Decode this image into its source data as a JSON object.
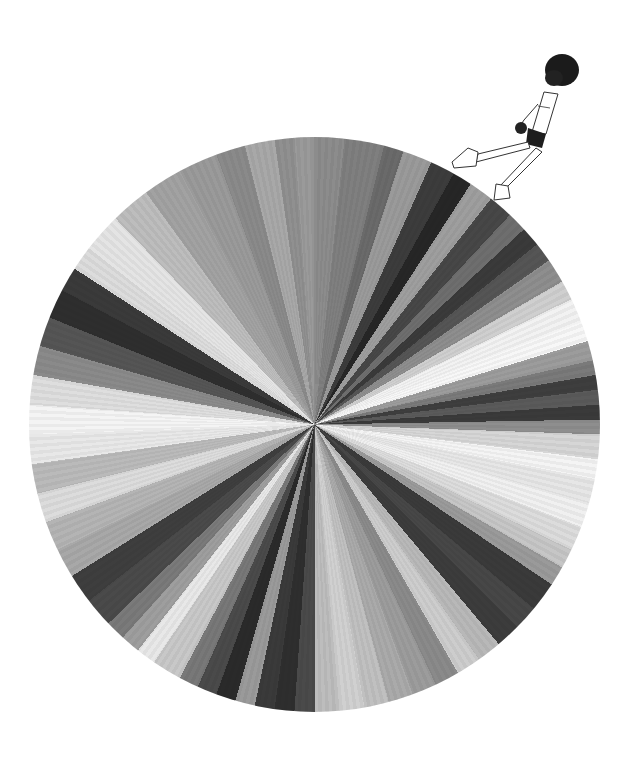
{
  "illustration": {
    "description": "Grayscale radial wheel of wedges with a small figure walking on its rim",
    "background": "#ffffff",
    "wheel": {
      "center": [
        314,
        422
      ],
      "radius_x": 285,
      "radius_y": 287,
      "wedges": [
        {
          "start": 0,
          "end": 6,
          "color": "#8c8c8c"
        },
        {
          "start": 6,
          "end": 14,
          "color": "#7f7f7f"
        },
        {
          "start": 14,
          "end": 18,
          "color": "#6a6a6a"
        },
        {
          "start": 18,
          "end": 24,
          "color": "#9a9a9a"
        },
        {
          "start": 24,
          "end": 29,
          "color": "#3c3c3c"
        },
        {
          "start": 29,
          "end": 33,
          "color": "#262626"
        },
        {
          "start": 33,
          "end": 38,
          "color": "#9e9e9e"
        },
        {
          "start": 38,
          "end": 43,
          "color": "#474747"
        },
        {
          "start": 43,
          "end": 47,
          "color": "#6e6e6e"
        },
        {
          "start": 47,
          "end": 51,
          "color": "#3a3a3a"
        },
        {
          "start": 51,
          "end": 55,
          "color": "#555555"
        },
        {
          "start": 55,
          "end": 60,
          "color": "#8e8e8e"
        },
        {
          "start": 60,
          "end": 64,
          "color": "#cfcfcf"
        },
        {
          "start": 64,
          "end": 69,
          "color": "#f2f2f2"
        },
        {
          "start": 69,
          "end": 73,
          "color": "#f7f7f7"
        },
        {
          "start": 73,
          "end": 77,
          "color": "#9c9c9c"
        },
        {
          "start": 77,
          "end": 80,
          "color": "#7a7a7a"
        },
        {
          "start": 80,
          "end": 83,
          "color": "#3e3e3e"
        },
        {
          "start": 83,
          "end": 86,
          "color": "#5a5a5a"
        },
        {
          "start": 86,
          "end": 89,
          "color": "#3a3a3a"
        },
        {
          "start": 89,
          "end": 92,
          "color": "#8e8e8e"
        },
        {
          "start": 92,
          "end": 97,
          "color": "#d6d6d6"
        },
        {
          "start": 97,
          "end": 101,
          "color": "#f4f4f4"
        },
        {
          "start": 101,
          "end": 106,
          "color": "#e6e6e6"
        },
        {
          "start": 106,
          "end": 111,
          "color": "#f0f0f0"
        },
        {
          "start": 111,
          "end": 116,
          "color": "#dcdcdc"
        },
        {
          "start": 116,
          "end": 120,
          "color": "#c6c6c6"
        },
        {
          "start": 120,
          "end": 124,
          "color": "#9a9a9a"
        },
        {
          "start": 124,
          "end": 130,
          "color": "#3a3a3a"
        },
        {
          "start": 130,
          "end": 135,
          "color": "#474747"
        },
        {
          "start": 135,
          "end": 140,
          "color": "#3c3c3c"
        },
        {
          "start": 140,
          "end": 145,
          "color": "#b8b8b8"
        },
        {
          "start": 145,
          "end": 150,
          "color": "#cdcdcd"
        },
        {
          "start": 150,
          "end": 155,
          "color": "#8a8a8a"
        },
        {
          "start": 155,
          "end": 160,
          "color": "#9c9c9c"
        },
        {
          "start": 160,
          "end": 165,
          "color": "#aaaaaa"
        },
        {
          "start": 165,
          "end": 170,
          "color": "#c0c0c0"
        },
        {
          "start": 170,
          "end": 175,
          "color": "#d0d0d0"
        },
        {
          "start": 175,
          "end": 180,
          "color": "#bdbdbd"
        },
        {
          "start": 180,
          "end": 184,
          "color": "#4a4a4a"
        },
        {
          "start": 184,
          "end": 188,
          "color": "#2e2e2e"
        },
        {
          "start": 188,
          "end": 192,
          "color": "#3a3a3a"
        },
        {
          "start": 192,
          "end": 196,
          "color": "#9a9a9a"
        },
        {
          "start": 196,
          "end": 200,
          "color": "#2a2a2a"
        },
        {
          "start": 200,
          "end": 204,
          "color": "#4a4a4a"
        },
        {
          "start": 204,
          "end": 208,
          "color": "#787878"
        },
        {
          "start": 208,
          "end": 214,
          "color": "#c8c8c8"
        },
        {
          "start": 214,
          "end": 218,
          "color": "#e8e8e8"
        },
        {
          "start": 218,
          "end": 222,
          "color": "#9e9e9e"
        },
        {
          "start": 222,
          "end": 226,
          "color": "#7a7a7a"
        },
        {
          "start": 226,
          "end": 232,
          "color": "#4a4a4a"
        },
        {
          "start": 232,
          "end": 238,
          "color": "#3e3e3e"
        },
        {
          "start": 238,
          "end": 244,
          "color": "#a8a8a8"
        },
        {
          "start": 244,
          "end": 250,
          "color": "#b4b4b4"
        },
        {
          "start": 250,
          "end": 256,
          "color": "#dcdcdc"
        },
        {
          "start": 256,
          "end": 262,
          "color": "#bababa"
        },
        {
          "start": 262,
          "end": 268,
          "color": "#e8e8e8"
        },
        {
          "start": 268,
          "end": 274,
          "color": "#f4f4f4"
        },
        {
          "start": 274,
          "end": 280,
          "color": "#dedede"
        },
        {
          "start": 280,
          "end": 286,
          "color": "#8a8a8a"
        },
        {
          "start": 286,
          "end": 292,
          "color": "#555555"
        },
        {
          "start": 292,
          "end": 298,
          "color": "#2e2e2e"
        },
        {
          "start": 298,
          "end": 303,
          "color": "#3a3a3a"
        },
        {
          "start": 303,
          "end": 308,
          "color": "#dcdcdc"
        },
        {
          "start": 308,
          "end": 316,
          "color": "#e4e4e4"
        },
        {
          "start": 316,
          "end": 324,
          "color": "#bdbdbd"
        },
        {
          "start": 324,
          "end": 332,
          "color": "#a2a2a2"
        },
        {
          "start": 332,
          "end": 340,
          "color": "#9a9a9a"
        },
        {
          "start": 340,
          "end": 346,
          "color": "#8a8a8a"
        },
        {
          "start": 346,
          "end": 352,
          "color": "#a8a8a8"
        },
        {
          "start": 352,
          "end": 356,
          "color": "#909090"
        },
        {
          "start": 356,
          "end": 360,
          "color": "#9a9a9a"
        }
      ]
    },
    "figure": {
      "pose": "walking on rim, leaning forward",
      "hair_color": "#1a1a1a",
      "line_color": "#333333"
    }
  }
}
